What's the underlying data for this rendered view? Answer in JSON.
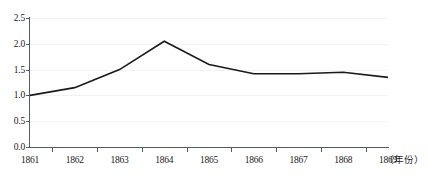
{
  "chart_data": {
    "type": "line",
    "title": "",
    "subtitle": "",
    "xlabel": "（年份）",
    "ylabel": "",
    "categories": [
      "1861",
      "1862",
      "1863",
      "1864",
      "1865",
      "1866",
      "1867",
      "1868",
      "1869"
    ],
    "x": [
      1861,
      1862,
      1863,
      1864,
      1865,
      1866,
      1867,
      1868,
      1869
    ],
    "values": [
      1.0,
      1.15,
      1.5,
      2.05,
      1.6,
      1.42,
      1.42,
      1.45,
      1.35
    ],
    "series": [
      {
        "name": "",
        "values": [
          1.0,
          1.15,
          1.5,
          2.05,
          1.6,
          1.42,
          1.42,
          1.45,
          1.35
        ]
      }
    ],
    "xlim": [
      1861,
      1869
    ],
    "ylim": [
      0.0,
      2.5
    ],
    "yticks": [
      "0.0",
      "0.5",
      "1.0",
      "1.5",
      "2.0",
      "2.5"
    ],
    "ytick_values": [
      0.0,
      0.5,
      1.0,
      1.5,
      2.0,
      2.5
    ],
    "grid": true,
    "legend": false,
    "legend_position": "none",
    "annotations": [],
    "line_color": "#1a1a1a",
    "axis_color": "#555a5e",
    "grid_color": "#f2f2f2",
    "background_color": "#ffffff"
  },
  "axis": {
    "x_unit_label": "（年份）"
  }
}
